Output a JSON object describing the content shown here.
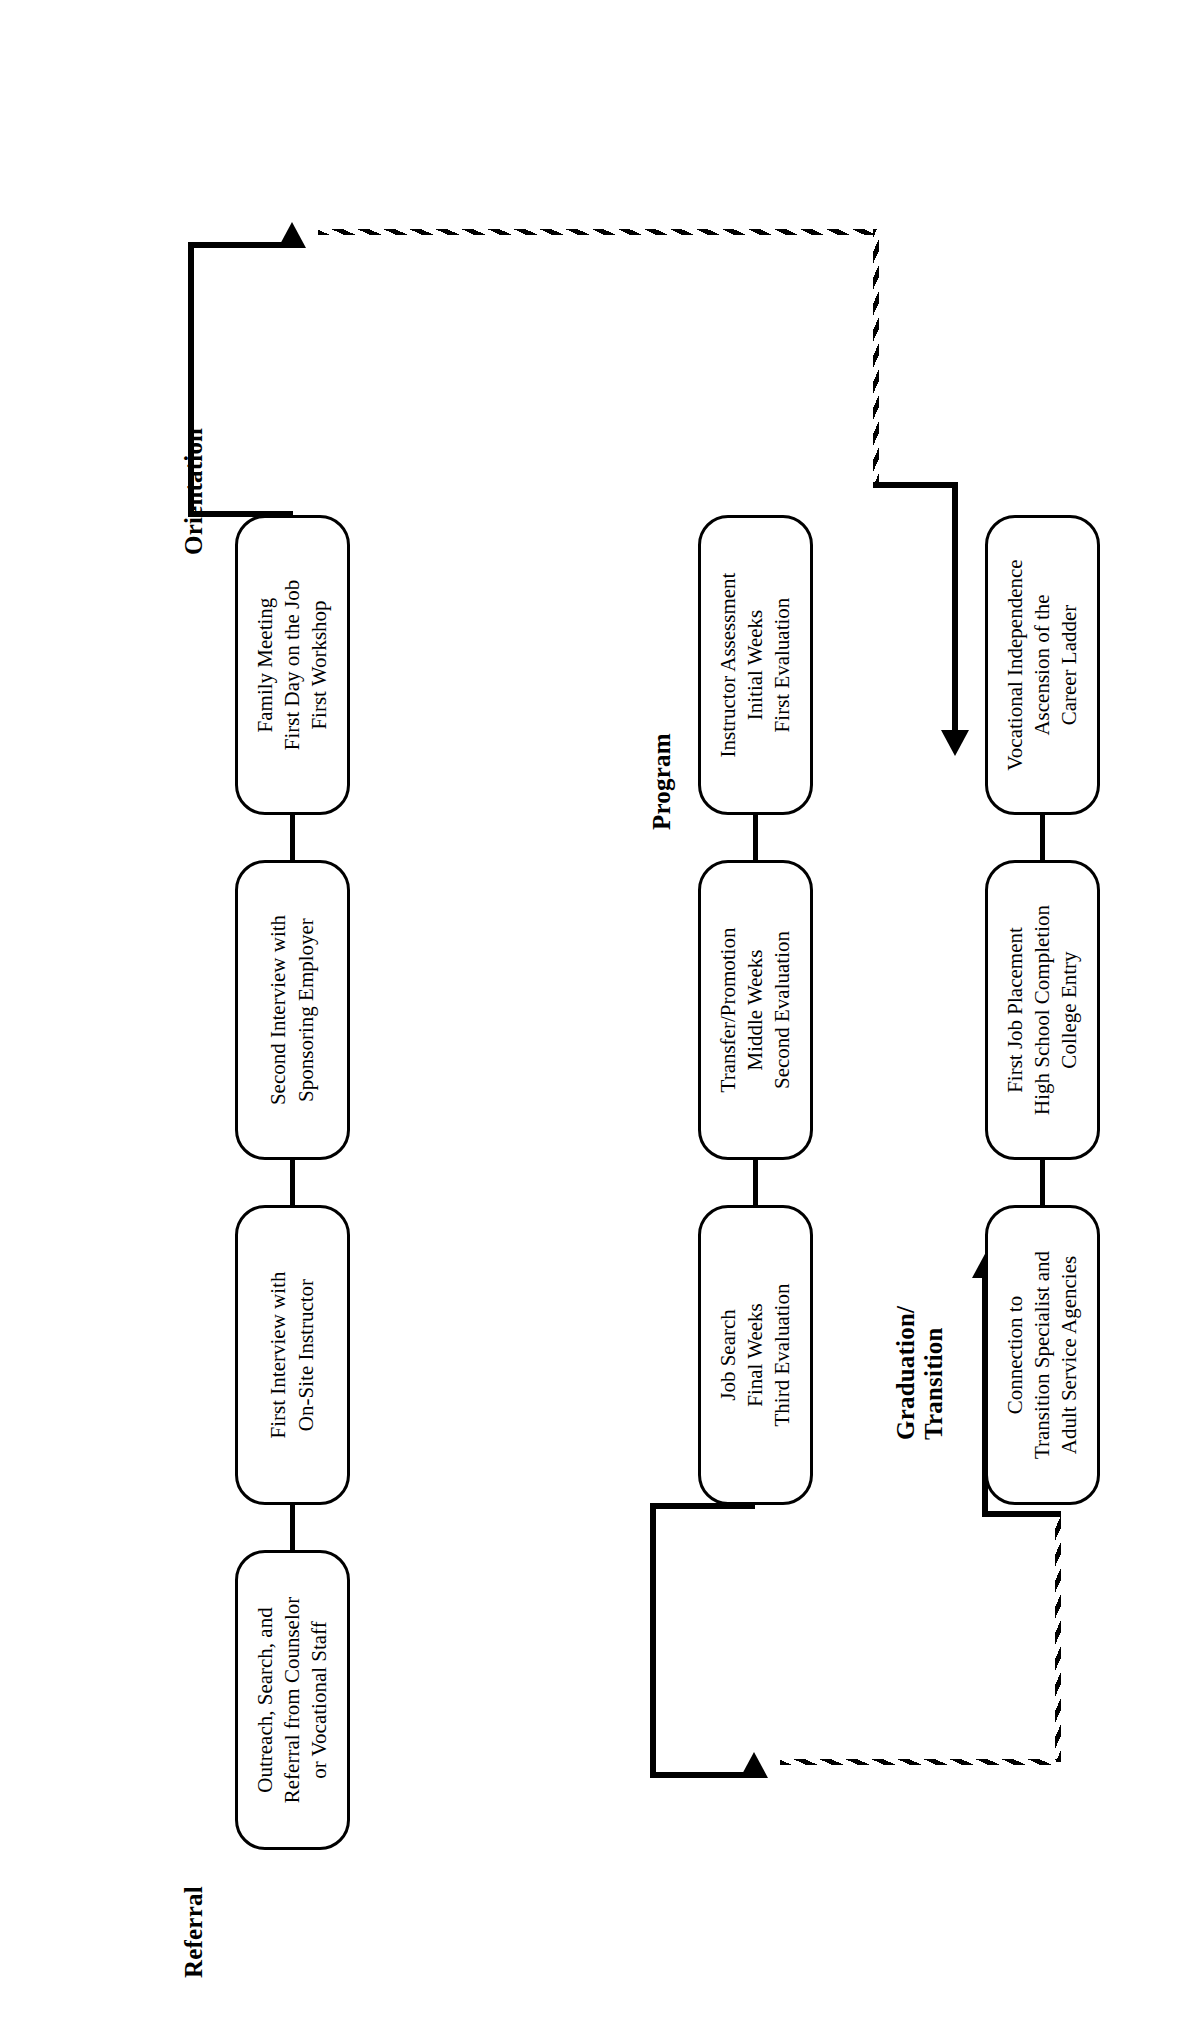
{
  "diagram": {
    "orientation": "rotated-90-ccw",
    "line_color": "#000000",
    "background_color": "#ffffff"
  },
  "sections": [
    {
      "id": "referral",
      "label": "Referral"
    },
    {
      "id": "orientation",
      "label": "Orientation"
    },
    {
      "id": "program",
      "label": "Program"
    },
    {
      "id": "graduation",
      "label": "Graduation/\nTransition"
    }
  ],
  "rows": [
    {
      "id": "row-1",
      "nodes": [
        {
          "id": "n1",
          "text": "Outreach, Search, and\nReferral from Counselor\nor Vocational Staff"
        },
        {
          "id": "n2",
          "text": "First Interview with\nOn-Site Instructor"
        },
        {
          "id": "n3",
          "text": "Second Interview with\nSponsoring Employer"
        },
        {
          "id": "n4",
          "text": "Family Meeting\nFirst Day on the Job\nFirst Workshop"
        }
      ]
    },
    {
      "id": "row-2",
      "nodes": [
        {
          "id": "n5",
          "text": "Instructor Assessment\nInitial Weeks\nFirst Evaluation"
        },
        {
          "id": "n6",
          "text": "Transfer/Promotion\nMiddle Weeks\nSecond Evaluation"
        },
        {
          "id": "n7",
          "text": "Job Search\nFinal Weeks\nThird Evaluation"
        }
      ]
    },
    {
      "id": "row-3",
      "nodes": [
        {
          "id": "n8",
          "text": "Connection to\nTransition Specialist and\nAdult Service Agencies"
        },
        {
          "id": "n9",
          "text": "First Job Placement\nHigh School Completion\nCollege Entry"
        },
        {
          "id": "n10",
          "text": "Vocational Independence\nAscension of the\nCareer Ladder"
        }
      ]
    }
  ],
  "connectors": [
    {
      "id": "c1",
      "from": "n1",
      "to": "n2",
      "style": "solid"
    },
    {
      "id": "c2",
      "from": "n2",
      "to": "n3",
      "style": "solid"
    },
    {
      "id": "c3",
      "from": "n3",
      "to": "n4",
      "style": "solid"
    },
    {
      "id": "c4",
      "from": "n4",
      "to": "n5",
      "style": "dashed",
      "arrow": "down-then-right"
    },
    {
      "id": "c5",
      "from": "n5",
      "to": "n6",
      "style": "solid"
    },
    {
      "id": "c6",
      "from": "n6",
      "to": "n7",
      "style": "solid"
    },
    {
      "id": "c7",
      "from": "n7",
      "to": "n8",
      "style": "dashed",
      "arrow": "down-then-right"
    },
    {
      "id": "c8",
      "from": "n8",
      "to": "n9",
      "style": "solid"
    },
    {
      "id": "c9",
      "from": "n9",
      "to": "n10",
      "style": "solid"
    }
  ]
}
